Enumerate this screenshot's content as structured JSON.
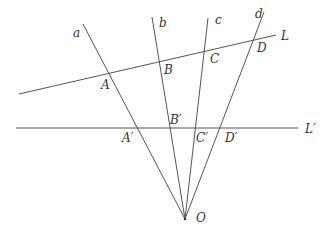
{
  "diagram": {
    "colors": {
      "line": "#555555",
      "text": "#333333",
      "background": "#ffffff"
    },
    "point_O": {
      "label": "O"
    },
    "rays": [
      {
        "id": "a",
        "label": "a"
      },
      {
        "id": "b",
        "label": "b"
      },
      {
        "id": "c",
        "label": "c"
      },
      {
        "id": "d",
        "label": "d"
      }
    ],
    "transversals": [
      {
        "id": "L",
        "label": "L"
      },
      {
        "id": "Lprime",
        "label": "L′"
      }
    ],
    "points_on_L": [
      {
        "label": "A"
      },
      {
        "label": "B"
      },
      {
        "label": "C"
      },
      {
        "label": "D"
      }
    ],
    "points_on_Lprime": [
      {
        "label": "A′"
      },
      {
        "label": "B′"
      },
      {
        "label": "C′"
      },
      {
        "label": "D′"
      }
    ]
  }
}
